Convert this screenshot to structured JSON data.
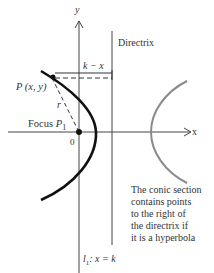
{
  "figure": {
    "axes": {
      "y_label": "y",
      "x_label": "x",
      "origin_label": "0"
    },
    "directrix": {
      "label": "Directrix",
      "equation_label_prefix": "l",
      "equation_label_sub": "1",
      "equation_label_rest": ": x = k"
    },
    "point_label": "P (x, y)",
    "distance_label": "r",
    "horizontal_distance_label": "k − x",
    "focus_label": "Focus",
    "focus_point_label": "P",
    "focus_point_sub": "1",
    "note_lines": [
      "The conic section",
      "contains points",
      "to the right of",
      "the directrix if",
      "it is a hyperbola"
    ],
    "colors": {
      "main_curve": "#111111",
      "other_branch": "#8a8a8a",
      "axes": "#444444"
    }
  }
}
